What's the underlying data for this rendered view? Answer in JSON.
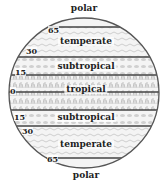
{
  "diagram": {
    "type": "latitude climate zones globe",
    "zones": [
      {
        "label": "polar",
        "position": "top"
      },
      {
        "label": "temperate",
        "position": "north"
      },
      {
        "label": "subtropical",
        "position": "north"
      },
      {
        "label": "tropical",
        "position": "equator"
      },
      {
        "label": "subtropical",
        "position": "south"
      },
      {
        "label": "temperate",
        "position": "south"
      },
      {
        "label": "polar",
        "position": "bottom"
      }
    ],
    "latitudes": [
      "65",
      "30",
      "15",
      "0",
      "15",
      "30",
      "65"
    ],
    "colors": {
      "outline": "#555555",
      "band_line": "#444444",
      "texture": "#b8b8b8",
      "background": "#ffffff"
    }
  }
}
